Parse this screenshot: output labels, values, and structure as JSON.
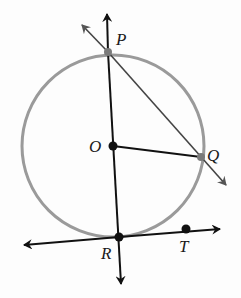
{
  "diagram": {
    "type": "circle-geometry",
    "colors": {
      "circle": "#9a9a9a",
      "line": "#111111",
      "point": "#111111",
      "point_on_circle": "#7a7a7a",
      "background": "#fdfdfd"
    },
    "circle": {
      "center": "O",
      "cx": 113,
      "cy": 146,
      "r": 91
    },
    "points": {
      "P": {
        "label": "P",
        "x": 108,
        "y": 52
      },
      "O": {
        "label": "O",
        "x": 113,
        "y": 146
      },
      "Q": {
        "label": "Q",
        "x": 201,
        "y": 157
      },
      "R": {
        "label": "R",
        "x": 119,
        "y": 237
      },
      "T": {
        "label": "T",
        "x": 186,
        "y": 229
      }
    },
    "lines": [
      {
        "name": "line-PR",
        "description": "line through P, O, R (diameter extended)",
        "arrows": "both"
      },
      {
        "name": "ray-PQ",
        "description": "line through P and Q",
        "arrows": "both"
      },
      {
        "name": "line-RT",
        "description": "tangent line at R through T",
        "arrows": "both"
      },
      {
        "name": "segment-OQ",
        "description": "radius OQ",
        "arrows": "none"
      }
    ]
  }
}
